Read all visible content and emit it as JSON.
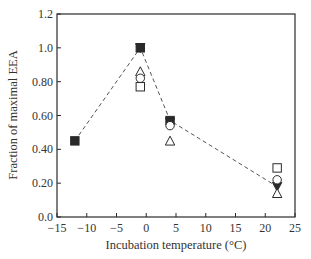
{
  "chart_data": {
    "type": "scatter",
    "title": "",
    "xlabel": "Incubation temperature (°C)",
    "ylabel": "Fraction of maximal EEA",
    "xlim": [
      -15,
      25
    ],
    "ylim": [
      0.0,
      1.2
    ],
    "xticks": [
      -15,
      -10,
      -5,
      0,
      5,
      10,
      15,
      20,
      25
    ],
    "xtick_labels": [
      "−15",
      "−10",
      "−5",
      "0",
      "5",
      "10",
      "15",
      "20",
      "25"
    ],
    "yticks": [
      0.0,
      0.2,
      0.4,
      0.6,
      0.8,
      1.0,
      1.2
    ],
    "ytick_labels": [
      "0.0",
      "0.20",
      "0.40",
      "0.60",
      "0.80",
      "1.0",
      "1.2"
    ],
    "grid": false,
    "legend": null,
    "series": [
      {
        "name": "filled-square",
        "marker": "square",
        "filled": true,
        "points": [
          {
            "x": -12,
            "y": 0.45
          },
          {
            "x": -1,
            "y": 1.0
          },
          {
            "x": 4,
            "y": 0.57
          }
        ]
      },
      {
        "name": "filled-down-triangle",
        "marker": "triangle-down",
        "filled": true,
        "points": [
          {
            "x": -1,
            "y": 1.0
          },
          {
            "x": 4,
            "y": 0.56
          },
          {
            "x": 22,
            "y": 0.18
          }
        ]
      },
      {
        "name": "open-triangle",
        "marker": "triangle-up",
        "filled": false,
        "points": [
          {
            "x": -1,
            "y": 0.86
          },
          {
            "x": 4,
            "y": 0.45
          },
          {
            "x": 22,
            "y": 0.14
          }
        ]
      },
      {
        "name": "open-circle",
        "marker": "circle",
        "filled": false,
        "points": [
          {
            "x": -1,
            "y": 0.82
          },
          {
            "x": 4,
            "y": 0.54
          },
          {
            "x": 22,
            "y": 0.22
          }
        ]
      },
      {
        "name": "open-square",
        "marker": "square",
        "filled": false,
        "points": [
          {
            "x": -1,
            "y": 0.77
          },
          {
            "x": 22,
            "y": 0.29
          }
        ]
      }
    ],
    "trend_line": {
      "style": "dashed",
      "points": [
        {
          "x": -12,
          "y": 0.45
        },
        {
          "x": -1,
          "y": 1.0
        },
        {
          "x": 4,
          "y": 0.57
        },
        {
          "x": 22,
          "y": 0.18
        }
      ]
    }
  }
}
